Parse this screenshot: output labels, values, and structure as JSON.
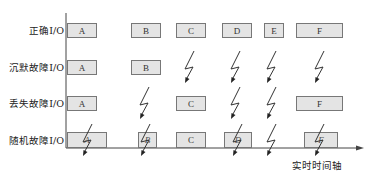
{
  "diagram": {
    "rows": [
      {
        "id": "correct",
        "label": "正确I/O",
        "center_y": 30,
        "items": [
          {
            "type": "box",
            "text": "A",
            "x": 67,
            "w": 30
          },
          {
            "type": "box",
            "text": "B",
            "x": 131,
            "w": 30
          },
          {
            "type": "box",
            "text": "C",
            "x": 176,
            "w": 30
          },
          {
            "type": "box",
            "text": "D",
            "x": 222,
            "w": 30
          },
          {
            "type": "box",
            "text": "E",
            "x": 264,
            "w": 20
          },
          {
            "type": "box",
            "text": "F",
            "x": 296,
            "w": 47
          }
        ]
      },
      {
        "id": "silent-fault",
        "label": "沉默故障I/O",
        "center_y": 67,
        "items": [
          {
            "type": "box",
            "text": "A",
            "x": 67,
            "w": 30
          },
          {
            "type": "box",
            "text": "B",
            "x": 131,
            "w": 30
          },
          {
            "type": "bolt",
            "x": 190
          },
          {
            "type": "bolt",
            "x": 236
          },
          {
            "type": "bolt",
            "x": 272
          },
          {
            "type": "bolt",
            "x": 320
          }
        ]
      },
      {
        "id": "lost-fault",
        "label": "丢失故障I/O",
        "center_y": 103,
        "items": [
          {
            "type": "box",
            "text": "A",
            "x": 67,
            "w": 30
          },
          {
            "type": "bolt",
            "x": 145
          },
          {
            "type": "box",
            "text": "C",
            "x": 176,
            "w": 30
          },
          {
            "type": "bolt",
            "x": 236
          },
          {
            "type": "bolt",
            "x": 272
          },
          {
            "type": "box",
            "text": "F",
            "x": 296,
            "w": 47
          }
        ]
      },
      {
        "id": "random-fault",
        "label": "随机故障I/O",
        "center_y": 140,
        "items": [
          {
            "type": "box",
            "text": "A",
            "x": 67,
            "w": 40,
            "garbled": true,
            "bolt_x": 88
          },
          {
            "type": "box",
            "text": "B",
            "x": 138,
            "w": 19,
            "garbled": true,
            "bolt_x": 146
          },
          {
            "type": "box",
            "text": "C",
            "x": 176,
            "w": 30
          },
          {
            "type": "box",
            "text": "D",
            "x": 224,
            "w": 28,
            "garbled": true,
            "bolt_x": 238
          },
          {
            "type": "bolt",
            "x": 272
          },
          {
            "type": "box",
            "text": "F",
            "x": 304,
            "w": 34,
            "garbled": true,
            "bolt_x": 320
          }
        ]
      }
    ],
    "axis": {
      "label": "实时时间轴",
      "origin_x": 66,
      "top_y": 13,
      "baseline_y": 148,
      "end_x": 364
    },
    "colors": {
      "box_fill": "#e4e4e4",
      "box_border": "#777777",
      "line": "#444444",
      "text": "#222222"
    }
  }
}
